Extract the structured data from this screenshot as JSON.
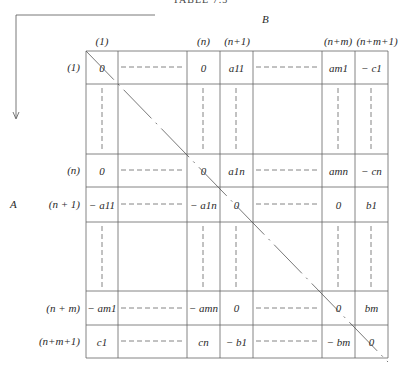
{
  "title": "TABLE 7.3",
  "axis_labels": {
    "top": "B",
    "left": "A"
  },
  "column_headers": [
    "(1)",
    "(n)",
    "(n+1)",
    "(n+m)",
    "(n+m+1)"
  ],
  "row_headers": [
    "(1)",
    "(n)",
    "(n + 1)",
    "(n + m)",
    "(n+m+1)"
  ],
  "rows": [
    [
      "0",
      "0",
      "a11",
      "am1",
      "− c1"
    ],
    [
      "0",
      "0",
      "a1n",
      "amn",
      "− cn"
    ],
    [
      "− a11",
      "− a1n",
      "0",
      "0",
      "b1"
    ],
    [
      "− am1",
      "− amn",
      "0",
      "0",
      "bm"
    ],
    [
      "c1",
      "cn",
      "− b1",
      "− bm",
      "0"
    ]
  ]
}
